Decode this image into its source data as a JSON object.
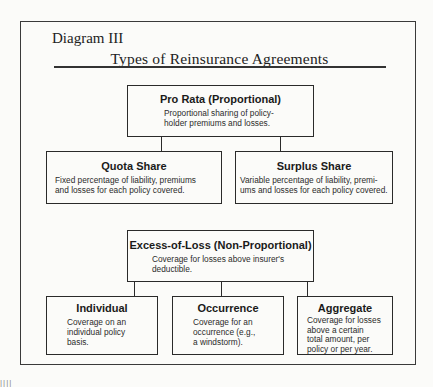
{
  "header": {
    "label": "Diagram III",
    "title": "Types of Reinsurance Agreements"
  },
  "proportional": {
    "root": {
      "title": "Pro Rata (Proportional)",
      "description_lines": [
        "Proportional sharing of policy-",
        "holder premiums and losses."
      ]
    },
    "children": [
      {
        "title": "Quota Share",
        "description_lines": [
          "Fixed percentage of liability, premiums",
          "and losses for each policy covered."
        ]
      },
      {
        "title": "Surplus Share",
        "description_lines": [
          "Variable percentage of liability, premi-",
          "ums and losses for each policy covered."
        ]
      }
    ]
  },
  "non_proportional": {
    "root": {
      "title": "Excess-of-Loss (Non-Proportional)",
      "description_lines": [
        "Coverage for losses above insurer's",
        "deductible."
      ]
    },
    "children": [
      {
        "title": "Individual",
        "description_lines": [
          "Coverage on an",
          "individual policy",
          "basis."
        ]
      },
      {
        "title": "Occurrence",
        "description_lines": [
          "Coverage for an",
          "occurrence (e.g.,",
          "a windstorm)."
        ]
      },
      {
        "title": "Aggregate",
        "description_lines": [
          "Coverage for losses",
          "above a certain",
          "total amount, per",
          "policy or per year."
        ]
      }
    ]
  },
  "margin_mark": "||||"
}
